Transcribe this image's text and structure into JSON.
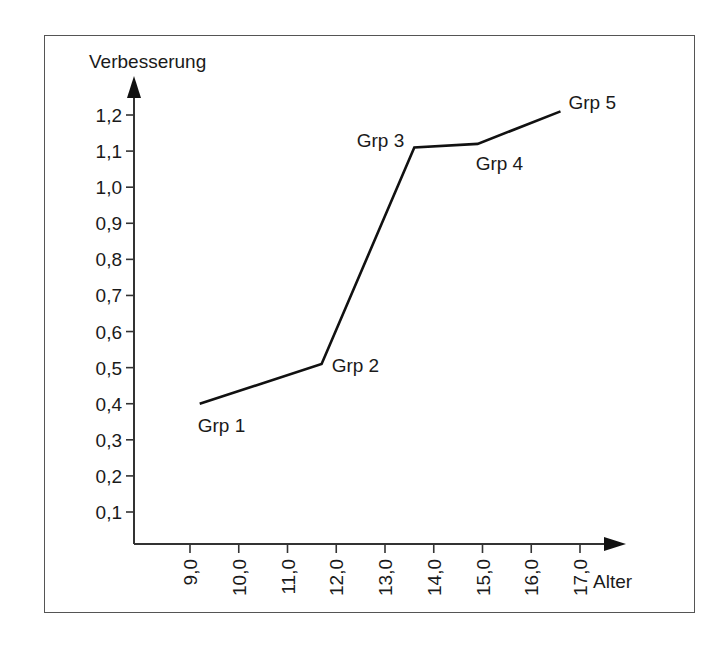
{
  "chart_data": {
    "type": "line",
    "title": "",
    "xlabel": "Alter",
    "ylabel": "Verbesserung",
    "x_ticks": [
      "9,0",
      "10,0",
      "11,0",
      "12,0",
      "13,0",
      "14,0",
      "15,0",
      "16,0",
      "17,0"
    ],
    "y_ticks": [
      "0,1",
      "0,2",
      "0,3",
      "0,4",
      "0,5",
      "0,6",
      "0,7",
      "0,8",
      "0,9",
      "1,0",
      "1,1",
      "1,2"
    ],
    "xlim": [
      8.1,
      17.9
    ],
    "ylim": [
      0.0,
      1.25
    ],
    "grid": false,
    "legend": null,
    "series": [
      {
        "name": "Verbesserung",
        "points": [
          {
            "label": "Grp 1",
            "x": 9.2,
            "y": 0.4
          },
          {
            "label": "Grp 2",
            "x": 11.7,
            "y": 0.51
          },
          {
            "label": "Grp 3",
            "x": 13.6,
            "y": 1.11
          },
          {
            "label": "Grp 4",
            "x": 14.9,
            "y": 1.12
          },
          {
            "label": "Grp 5",
            "x": 16.6,
            "y": 1.21
          }
        ]
      }
    ]
  }
}
